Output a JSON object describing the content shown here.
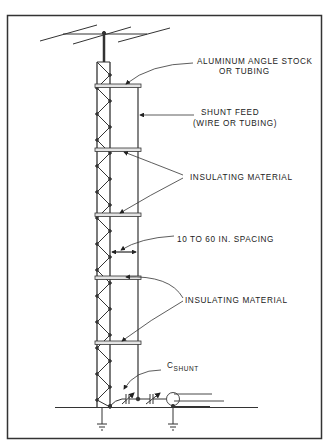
{
  "diagram": {
    "labels": {
      "aluminum_line1": "ALUMINUM ANGLE STOCK",
      "aluminum_line2": "OR TUBING",
      "shunt_feed_line1": "SHUNT FEED",
      "shunt_feed_line2": "(WIRE OR TUBING)",
      "insulating_upper": "INSULATING MATERIAL",
      "spacing": "10 TO 60 IN.  SPACING",
      "insulating_lower": "INSULATING MATERIAL",
      "c_shunt_main": "C",
      "c_shunt_sub": "SHUNT"
    },
    "components": [
      "beam-antenna",
      "lattice-tower",
      "shunt-feed-wire",
      "insulating-crossbars",
      "shunt-capacitors",
      "coax-connector",
      "ground-symbols"
    ],
    "colors": {
      "ink": "#222222",
      "background": "#ffffff",
      "crossbar": "#dddddd"
    }
  }
}
